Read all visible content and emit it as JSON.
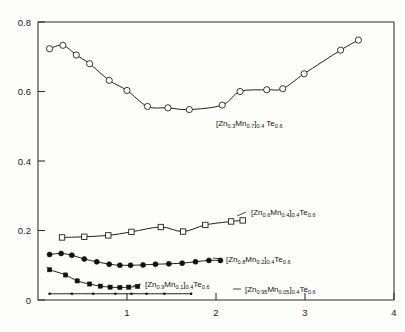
{
  "chart_data": {
    "type": "line",
    "title": "",
    "subtitle": "",
    "xlabel": "",
    "ylabel": "",
    "xlim": [
      0,
      4
    ],
    "ylim": [
      0,
      0.8
    ],
    "grid": false,
    "legend_position": "inline-annotations",
    "x_ticks": [
      "1",
      "2",
      "3",
      "4"
    ],
    "x_tick_values": [
      1,
      2,
      3,
      4
    ],
    "y_ticks": [
      "0",
      "0.2",
      "0.4",
      "0.6",
      "0.8"
    ],
    "y_tick_values": [
      0,
      0.2,
      0.4,
      0.6,
      0.8
    ],
    "series": [
      {
        "name": "[Zn0.3Mn0.7]0.4Te0.6",
        "label_parts": {
          "b1": "[Zn",
          "s1": "0.3",
          "b2": "Mn",
          "s2": "0.7",
          "b3": "]",
          "s3": "0.4",
          "b4": " Te",
          "s4": "0.6"
        },
        "marker": "open-circle",
        "x": [
          0.13,
          0.28,
          0.43,
          0.58,
          0.8,
          1.0,
          1.23,
          1.46,
          1.7,
          2.07,
          2.27,
          2.57,
          2.75,
          2.99,
          3.4,
          3.6
        ],
        "y": [
          0.723,
          0.733,
          0.705,
          0.68,
          0.632,
          0.603,
          0.557,
          0.553,
          0.548,
          0.561,
          0.6,
          0.605,
          0.608,
          0.651,
          0.719,
          0.748
        ]
      },
      {
        "name": "[Zn0.6Mn0.4]0.4Te0.6",
        "label_parts": {
          "b1": "[Zn",
          "s1": "0.6",
          "b2": "Mn",
          "s2": "0.4",
          "b3": "]",
          "s3": "0.4",
          "b4": "Te",
          "s4": "0.6"
        },
        "marker": "open-square",
        "x": [
          0.27,
          0.52,
          0.79,
          1.05,
          1.38,
          1.63,
          1.88,
          2.17,
          2.3
        ],
        "y": [
          0.18,
          0.182,
          0.186,
          0.196,
          0.21,
          0.197,
          0.216,
          0.226,
          0.229
        ]
      },
      {
        "name": "[Zn0.8Mn0.2]0.4Te0.6",
        "label_parts": {
          "b1": "[Zn",
          "s1": "0.8",
          "b2": "Mn",
          "s2": "0.2",
          "b3": "]",
          "s3": "0.4",
          "b4": "Te",
          "s4": "0.6"
        },
        "marker": "filled-circle",
        "x": [
          0.13,
          0.26,
          0.38,
          0.52,
          0.66,
          0.8,
          0.92,
          1.04,
          1.18,
          1.32,
          1.47,
          1.62,
          1.77,
          1.92,
          2.05
        ],
        "y": [
          0.131,
          0.134,
          0.129,
          0.118,
          0.11,
          0.103,
          0.1,
          0.1,
          0.101,
          0.103,
          0.104,
          0.106,
          0.11,
          0.114,
          0.114
        ]
      },
      {
        "name": "[Zn0.9Mn0.1]0.4Te0.6",
        "label_parts": {
          "b1": "[Zn",
          "s1": "0.9",
          "b2": "Mn",
          "s2": "0.1",
          "b3": "]",
          "s3": "0.4",
          "b4": "Te",
          "s4": "0.6"
        },
        "marker": "filled-square",
        "x": [
          0.13,
          0.31,
          0.44,
          0.58,
          0.7,
          0.81,
          0.92,
          1.02,
          1.12
        ],
        "y": [
          0.087,
          0.072,
          0.055,
          0.046,
          0.04,
          0.037,
          0.036,
          0.037,
          0.039
        ]
      },
      {
        "name": "[Zn0.95Mn0.05]0.4Te0.6",
        "label_parts": {
          "b1": "[Zn",
          "s1": "0.95",
          "b2": "Mn",
          "s2": "0.05",
          "b3": "]",
          "s3": "0.4",
          "b4": "Te",
          "s4": "0.6"
        },
        "marker": "small-dot",
        "x": [
          0.13,
          0.38,
          0.62,
          0.87,
          1.05,
          1.22,
          1.42,
          1.72
        ],
        "y": [
          0.018,
          0.018,
          0.018,
          0.018,
          0.018,
          0.018,
          0.018,
          0.018
        ]
      }
    ]
  },
  "axes": {
    "y_label_0": "0",
    "y_label_1": "0.2",
    "y_label_2": "0.4",
    "y_label_3": "0.6",
    "y_label_4": "0.8",
    "x_label_1": "1",
    "x_label_2": "2",
    "x_label_3": "3",
    "x_label_4": "4"
  }
}
